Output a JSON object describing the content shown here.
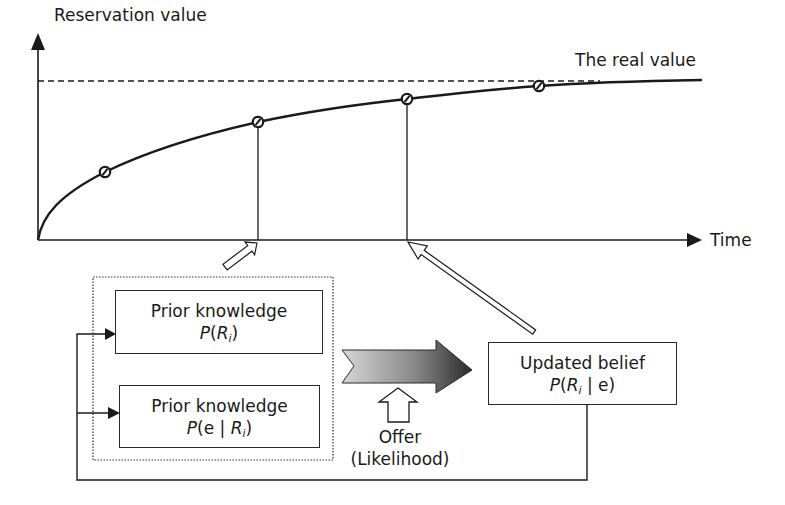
{
  "diagram": {
    "y_axis_label": "Reservation value",
    "x_axis_label": "Time",
    "real_value_label": "The real value",
    "boxes": {
      "prior_1": {
        "title": "Prior knowledge",
        "formula_prefix": "P",
        "formula_open": "(",
        "formula_var": "R",
        "formula_sub": "i",
        "formula_close": ")"
      },
      "prior_2": {
        "title": "Prior knowledge",
        "formula_prefix": "P",
        "formula_open": "(e | ",
        "formula_var": "R",
        "formula_sub": "i",
        "formula_close": ")"
      },
      "updated": {
        "title": "Updated belief",
        "formula_prefix": "P",
        "formula_open": "(",
        "formula_var": "R",
        "formula_sub": "i",
        "formula_close": " | e)"
      }
    },
    "offer_label_line1": "Offer",
    "offer_label_line2": "(Likelihood)",
    "markers": [
      {
        "x": 105,
        "y": 172
      },
      {
        "x": 258,
        "y": 122
      },
      {
        "x": 407,
        "y": 99
      },
      {
        "x": 539,
        "y": 86
      }
    ],
    "colors": {
      "line": "#1a1a1a",
      "gradient_arrow_start": "#d8d8d8",
      "gradient_arrow_end": "#2e2e2e"
    }
  }
}
